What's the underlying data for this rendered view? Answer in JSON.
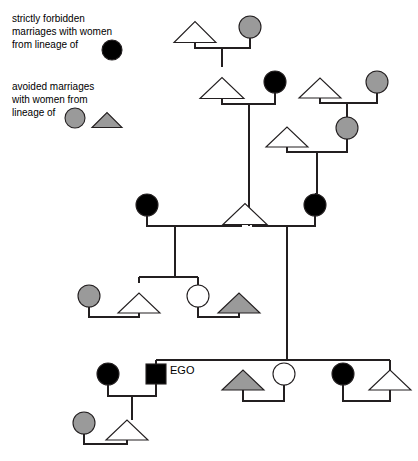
{
  "legend": {
    "entries": [
      {
        "id": "strictly-forbidden",
        "lines": [
          "strictly forbidden",
          "marriages with women",
          "from lineage of"
        ],
        "symbols": [
          {
            "shape": "circle",
            "fill": "black",
            "cx": 112,
            "cy": 50,
            "r": 10
          }
        ]
      },
      {
        "id": "avoided",
        "lines": [
          "avoided marriages",
          "with women from",
          "lineage of"
        ],
        "symbols": [
          {
            "shape": "circle",
            "fill": "gray",
            "cx": 75,
            "cy": 118,
            "r": 10
          },
          {
            "shape": "triangle",
            "fill": "gray",
            "cx": 107,
            "cy": 120,
            "half": 15,
            "h": 15
          }
        ]
      }
    ]
  },
  "ego": {
    "label": "EGO",
    "label_x": 170,
    "label_y": 374
  },
  "colors": {
    "black": "#000000",
    "gray": "#9a9a9a",
    "white": "#ffffff",
    "stroke": "#231f20"
  },
  "diagram": {
    "type": "kinship-genealogy",
    "nodes": [
      {
        "id": "g1-m1",
        "shape": "triangle",
        "fill": "white",
        "cx": 195,
        "cy": 32,
        "half": 21,
        "h": 21,
        "gen": 1,
        "role": "husband"
      },
      {
        "id": "g1-f1",
        "shape": "circle",
        "fill": "gray",
        "cx": 250,
        "cy": 27,
        "r": 11,
        "gen": 1,
        "role": "wife"
      },
      {
        "id": "g2-m1",
        "shape": "triangle",
        "fill": "white",
        "cx": 222,
        "cy": 88,
        "half": 22,
        "h": 21,
        "gen": 2,
        "role": "husband"
      },
      {
        "id": "g2-f1",
        "shape": "circle",
        "fill": "black",
        "cx": 275,
        "cy": 82,
        "r": 11,
        "gen": 2,
        "role": "wife"
      },
      {
        "id": "g2-m2",
        "shape": "triangle",
        "fill": "white",
        "cx": 320,
        "cy": 88,
        "half": 21,
        "h": 20,
        "gen": 2,
        "role": "husband"
      },
      {
        "id": "g2-f2",
        "shape": "circle",
        "fill": "gray",
        "cx": 377,
        "cy": 82,
        "r": 11,
        "gen": 2,
        "role": "wife"
      },
      {
        "id": "g3-m1",
        "shape": "triangle",
        "fill": "white",
        "cx": 287,
        "cy": 137,
        "half": 21,
        "h": 20,
        "gen": 3,
        "role": "husband"
      },
      {
        "id": "g3-f1",
        "shape": "circle",
        "fill": "gray",
        "cx": 347,
        "cy": 128,
        "r": 11,
        "gen": 3,
        "role": "wife"
      },
      {
        "id": "g4-f1",
        "shape": "circle",
        "fill": "black",
        "cx": 147,
        "cy": 205,
        "r": 11,
        "gen": 4,
        "role": "wife"
      },
      {
        "id": "g4-m1",
        "shape": "triangle",
        "fill": "white",
        "cx": 245,
        "cy": 214,
        "half": 22,
        "h": 21,
        "gen": 4,
        "role": "husband"
      },
      {
        "id": "g4-f2",
        "shape": "circle",
        "fill": "black",
        "cx": 315,
        "cy": 205,
        "r": 11,
        "gen": 4,
        "role": "wife"
      },
      {
        "id": "g5-f1",
        "shape": "circle",
        "fill": "gray",
        "cx": 89,
        "cy": 296,
        "r": 11,
        "gen": 5,
        "role": "wife"
      },
      {
        "id": "g5-m1",
        "shape": "triangle",
        "fill": "white",
        "cx": 139,
        "cy": 303,
        "half": 21,
        "h": 20,
        "gen": 5,
        "role": "husband"
      },
      {
        "id": "g5-f2",
        "shape": "circle",
        "fill": "white",
        "cx": 198,
        "cy": 296,
        "r": 11,
        "gen": 5,
        "role": "wife"
      },
      {
        "id": "g5-m2",
        "shape": "triangle",
        "fill": "gray",
        "cx": 239,
        "cy": 303,
        "half": 21,
        "h": 20,
        "gen": 5,
        "role": "husband"
      },
      {
        "id": "g6-f1",
        "shape": "circle",
        "fill": "black",
        "cx": 108,
        "cy": 374,
        "r": 11,
        "gen": 6,
        "role": "wife"
      },
      {
        "id": "g6-ego",
        "shape": "square",
        "fill": "black",
        "cx": 156,
        "cy": 374,
        "half": 10,
        "gen": 6,
        "role": "ego"
      },
      {
        "id": "g6-m2",
        "shape": "triangle",
        "fill": "gray",
        "cx": 243,
        "cy": 380,
        "half": 21,
        "h": 20,
        "gen": 6,
        "role": "husband"
      },
      {
        "id": "g6-f2",
        "shape": "circle",
        "fill": "white",
        "cx": 284,
        "cy": 374,
        "r": 11,
        "gen": 6,
        "role": "wife"
      },
      {
        "id": "g6-f3",
        "shape": "circle",
        "fill": "black",
        "cx": 343,
        "cy": 374,
        "r": 11,
        "gen": 6,
        "role": "wife"
      },
      {
        "id": "g6-m3",
        "shape": "triangle",
        "fill": "white",
        "cx": 390,
        "cy": 380,
        "half": 21,
        "h": 20,
        "gen": 6,
        "role": "husband"
      },
      {
        "id": "g7-f1",
        "shape": "circle",
        "fill": "gray",
        "cx": 84,
        "cy": 423,
        "r": 11,
        "gen": 7,
        "role": "wife"
      },
      {
        "id": "g7-m1",
        "shape": "triangle",
        "fill": "white",
        "cx": 127,
        "cy": 430,
        "half": 21,
        "h": 20,
        "gen": 7,
        "role": "husband"
      }
    ],
    "links": [
      {
        "id": "marr-g1",
        "type": "marriage",
        "d": "M195,43 L195,48 L250,48 L250,38"
      },
      {
        "id": "desc-g1",
        "type": "descent",
        "d": "M222,48 L222,67"
      },
      {
        "id": "marr-g2a",
        "type": "marriage",
        "d": "M222,99 L222,104 L275,104 L275,93"
      },
      {
        "id": "desc-g2a",
        "type": "descent",
        "d": "M249,104 L249,226"
      },
      {
        "id": "marr-g2b",
        "type": "marriage",
        "d": "M320,98 L320,103 L377,103 L377,93"
      },
      {
        "id": "desc-g2b",
        "type": "descent",
        "d": "M347,103 L347,117"
      },
      {
        "id": "marr-g3",
        "type": "marriage",
        "d": "M287,147 L287,152 L347,152 L347,139"
      },
      {
        "id": "desc-g3",
        "type": "descent",
        "d": "M317,152 L317,194"
      },
      {
        "id": "desc-g3b",
        "type": "descent",
        "d": "M317,194 L315,194"
      },
      {
        "id": "marr-g4a",
        "type": "marriage",
        "d": "M147,216 L147,226 L242,226"
      },
      {
        "id": "marr-g4b",
        "type": "marriage",
        "d": "M252,226 L315,226 L315,216"
      },
      {
        "id": "desc-g4a",
        "type": "descent",
        "d": "M175,226 L175,277"
      },
      {
        "id": "desc-g4b",
        "type": "descent",
        "d": "M287,226 L287,360"
      },
      {
        "id": "sib-g5",
        "type": "sibling",
        "d": "M139,277 L198,277"
      },
      {
        "id": "sib-g5-l",
        "type": "sibling-drop",
        "d": "M139,277 L139,283"
      },
      {
        "id": "sib-g5-r",
        "type": "sibling-drop",
        "d": "M198,277 L198,285"
      },
      {
        "id": "marr-g5a",
        "type": "marriage",
        "d": "M89,307 L89,317 L139,317 L139,313"
      },
      {
        "id": "marr-g5b",
        "type": "marriage",
        "d": "M198,307 L198,317 L239,317 L239,313"
      },
      {
        "id": "sib-g6",
        "type": "sibling",
        "d": "M156,360 L390,360"
      },
      {
        "id": "sib-g6-ego",
        "type": "sibling-drop",
        "d": "M156,360 L156,364"
      },
      {
        "id": "sib-g6-r",
        "type": "sibling-drop",
        "d": "M390,360 L390,390"
      },
      {
        "id": "marr-g6a",
        "type": "marriage",
        "d": "M108,385 L108,396 L156,396 L156,384"
      },
      {
        "id": "desc-g6a",
        "type": "descent",
        "d": "M132,396 L132,420"
      },
      {
        "id": "marr-g6b",
        "type": "marriage",
        "d": "M243,390 L243,401 L284,401 L284,385"
      },
      {
        "id": "marr-g6c",
        "type": "marriage",
        "d": "M343,385 L343,401 L390,401 L390,390"
      },
      {
        "id": "marr-g7",
        "type": "marriage",
        "d": "M84,434 L84,444 L127,444 L127,440"
      }
    ]
  }
}
